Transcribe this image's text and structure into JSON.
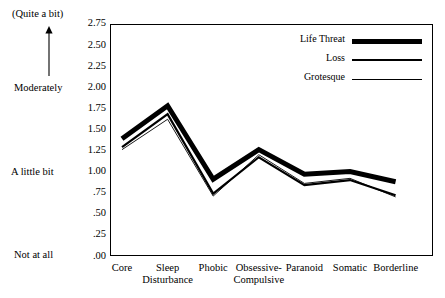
{
  "chart_data": {
    "type": "line",
    "title": "",
    "xlabel": "",
    "ylabel": "",
    "ylim": [
      0.0,
      2.75
    ],
    "grid": false,
    "legend_position": "top-right",
    "categories": [
      "Core",
      "Sleep Disturbance",
      "Phobic",
      "Obsessive-Compulsive",
      "Paranoid",
      "Somatic",
      "Borderline"
    ],
    "ytick_labels": [
      "2.75",
      "2.50",
      "2.25",
      "2.00",
      "1.75",
      "1.50",
      "1.25",
      "1.00",
      ".75",
      ".50",
      ".25",
      ".00"
    ],
    "ytick_values": [
      2.75,
      2.5,
      2.25,
      2.0,
      1.75,
      1.5,
      1.25,
      1.0,
      0.75,
      0.5,
      0.25,
      0.0
    ],
    "anchor_labels": [
      {
        "text": "(Quite a bit)",
        "value": 2.75
      },
      {
        "text": "Moderately",
        "value": 2.0
      },
      {
        "text": "A little bit",
        "value": 1.0
      },
      {
        "text": "Not at all",
        "value": 0.0
      }
    ],
    "series": [
      {
        "name": "Life Threat",
        "style": "thick",
        "width": 5.0,
        "values": [
          1.39,
          1.78,
          0.91,
          1.26,
          0.97,
          1.0,
          0.88
        ]
      },
      {
        "name": "Loss",
        "style": "medium",
        "width": 2.2,
        "values": [
          1.29,
          1.68,
          0.74,
          1.17,
          0.84,
          0.9,
          0.72
        ]
      },
      {
        "name": "Grotesque",
        "style": "thin",
        "width": 0.9,
        "values": [
          1.26,
          1.62,
          0.71,
          1.2,
          0.86,
          0.92,
          0.7
        ]
      }
    ]
  },
  "legend": {
    "entries": [
      {
        "label": "Life Threat"
      },
      {
        "label": "Loss"
      },
      {
        "label": "Grotesque"
      }
    ]
  },
  "axis": {
    "arrow_icon": "up-arrow-icon"
  }
}
